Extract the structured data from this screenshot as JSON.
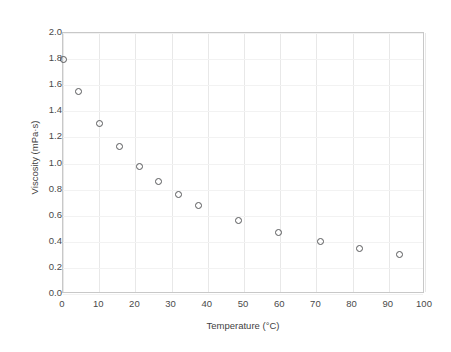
{
  "chart_data": {
    "type": "scatter",
    "title": "",
    "xlabel": "Temperature (°C)",
    "ylabel": "Viscosity (mPa·s)",
    "xlim": [
      0,
      100
    ],
    "ylim": [
      0.0,
      2.0
    ],
    "xticks": [
      "0",
      "10",
      "20",
      "30",
      "40",
      "50",
      "60",
      "70",
      "80",
      "90",
      "100"
    ],
    "xtick_values": [
      0,
      10,
      20,
      30,
      40,
      50,
      60,
      70,
      80,
      90,
      100
    ],
    "yticks": [
      "0.0",
      "0.2",
      "0.4",
      "0.6",
      "0.8",
      "1.0",
      "1.2",
      "1.4",
      "1.6",
      "1.8",
      "2.0"
    ],
    "ytick_values": [
      0.0,
      0.2,
      0.4,
      0.6,
      0.8,
      1.0,
      1.2,
      1.4,
      1.6,
      1.8,
      2.0
    ],
    "grid": true,
    "grid_axes": "both",
    "legend": false,
    "marker": "open-circle",
    "marker_color": "#57585a",
    "marker_fill": "none",
    "series": [
      {
        "name": "Viscosity of water",
        "x": [
          0,
          4.2,
          10,
          15.5,
          21,
          26.5,
          32,
          37.5,
          48.5,
          59.5,
          71,
          82,
          93
        ],
        "y": [
          1.8,
          1.55,
          1.31,
          1.13,
          0.98,
          0.86,
          0.76,
          0.68,
          0.56,
          0.47,
          0.4,
          0.345,
          0.3
        ]
      }
    ]
  },
  "colors": {
    "background": "#ffffff",
    "frame": "#c8c8c8",
    "gridline_vertical": "#e8e8e8",
    "gridline_horizontal": "#f2f2f2",
    "tick_text": "#4a4a4a",
    "axis_title": "#3f3f3f"
  }
}
